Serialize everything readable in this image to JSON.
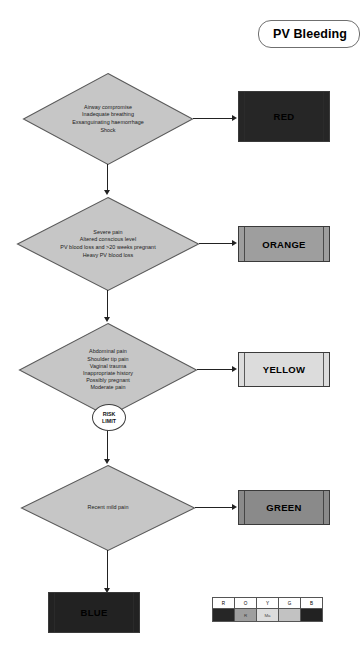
{
  "title": {
    "label": "PV Bleeding"
  },
  "colors": {
    "red": "#262626",
    "orange": "#9e9e9e",
    "yellow": "#dcdcdc",
    "green": "#8a8a8a",
    "blue": "#222222",
    "diamond_fill": "#c6c6c6",
    "diamond_stroke": "#5a5a5a",
    "line": "#222222",
    "red_text": "#000000",
    "orange_text": "#000000",
    "yellow_text": "#000000",
    "green_text": "#000000",
    "blue_text": "#000000"
  },
  "nodes": {
    "red_criteria": {
      "lines": [
        "Airway compromise",
        "Inadequate breathing",
        "Exsanguinating haemorrhage",
        "Shock"
      ]
    },
    "orange_criteria": {
      "lines": [
        "Severe pain",
        "Altered conscious level",
        "PV blood loss and >20 weeks pregnant",
        "Heavy PV blood loss"
      ]
    },
    "yellow_criteria": {
      "lines": [
        "Abdominal pain",
        "Shoulder tip pain",
        "Vaginal trauma",
        "Inappropriate history",
        "Possibly pregnant",
        "Moderate pain"
      ]
    },
    "green_criteria": {
      "lines": [
        "Recent mild pain"
      ]
    }
  },
  "risk_limit": {
    "line1": "RISK",
    "line2": "LIMIT"
  },
  "categories": {
    "red": "RED",
    "orange": "ORANGE",
    "yellow": "YELLOW",
    "green": "GREEN",
    "blue": "BLUE"
  },
  "legend": {
    "headers": [
      "R",
      "O",
      "Y",
      "G",
      "B"
    ],
    "values": [
      "",
      "R",
      "Ma",
      "",
      ""
    ]
  }
}
